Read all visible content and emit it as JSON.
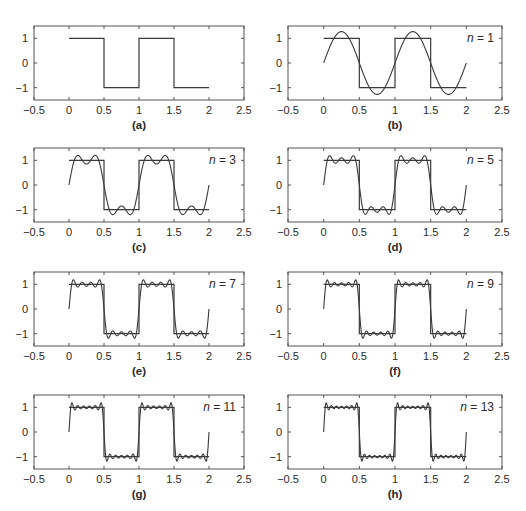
{
  "chart_data": {
    "type": "line",
    "layout": "4x2 grid of subplots",
    "shared_axes": {
      "xlim": [
        -0.5,
        2.5
      ],
      "ylim": [
        -1.5,
        1.5
      ],
      "xticks": [
        -0.5,
        0,
        0.5,
        1,
        1.5,
        2,
        2.5
      ],
      "xtick_labels": [
        "−0.5",
        "0",
        "0.5",
        "1",
        "1.5",
        "2",
        "2.5"
      ],
      "yticks": [
        1,
        0,
        -1
      ],
      "ytick_labels": [
        "1",
        "0",
        "−1"
      ],
      "grid": false,
      "xlabel": "",
      "ylabel": ""
    },
    "square_wave": {
      "name": "square wave",
      "x": [
        0,
        0.5,
        0.5,
        1,
        1,
        1.5,
        1.5,
        2
      ],
      "y": [
        1,
        1,
        -1,
        -1,
        1,
        1,
        -1,
        -1
      ]
    },
    "approximation": {
      "formula": "f_n(t) = (4/π) Σ_{k odd, k≤n} sin(2πkt)/k",
      "t_range": [
        0,
        2
      ],
      "samples": 600
    },
    "panels": [
      {
        "id": "a",
        "label": "(a)",
        "n": null,
        "n_label": ""
      },
      {
        "id": "b",
        "label": "(b)",
        "n": 1,
        "n_label": "n = 1"
      },
      {
        "id": "c",
        "label": "(c)",
        "n": 3,
        "n_label": "n = 3"
      },
      {
        "id": "d",
        "label": "(d)",
        "n": 5,
        "n_label": "n = 5"
      },
      {
        "id": "e",
        "label": "(e)",
        "n": 7,
        "n_label": "n = 7"
      },
      {
        "id": "f",
        "label": "(f)",
        "n": 9,
        "n_label": "n = 9"
      },
      {
        "id": "g",
        "label": "(g)",
        "n": 11,
        "n_label": "n = 11"
      },
      {
        "id": "h",
        "label": "(h)",
        "n": 13,
        "n_label": "n = 13"
      }
    ]
  },
  "style": {
    "line_color": "#3a3a3a",
    "axis_color": "#555555",
    "text_color": "#2a2a2a",
    "background": "#ffffff"
  }
}
